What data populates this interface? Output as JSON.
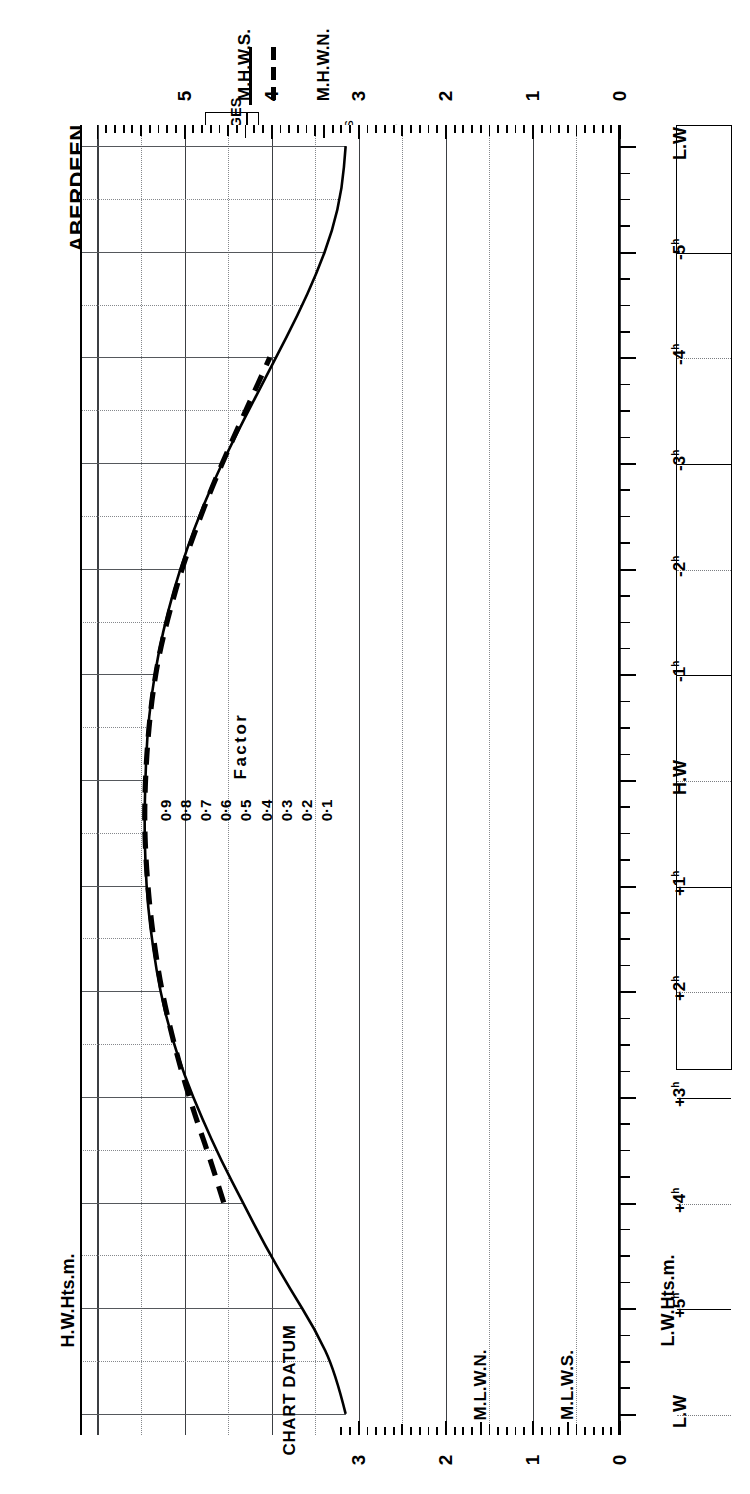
{
  "title": {
    "port": "ABERDEEN",
    "subtitle_line1": "MEAN SPRING",
    "subtitle_line2": "AND NEAP CURVES"
  },
  "legend": {
    "heading": "MEAN RANGES",
    "springs_label": "Springs",
    "springs_value": "3.7m",
    "neaps_label": "Neaps",
    "neaps_value": "1.8m",
    "springs_style": "solid-line",
    "neaps_style": "dashed-line"
  },
  "note": {
    "line1": "Springs occur 2 days",
    "line2": "after",
    "line3": "New and Full Moon."
  },
  "axes": {
    "left_caption": "H.W.Hts.m.",
    "right_caption": "L.W.Hts.m.",
    "datum_label": "CHART DATUM",
    "factor_caption": "Factor",
    "hw_height_labels": [
      "0",
      "1",
      "2",
      "3",
      "4",
      "5"
    ],
    "lw_height_labels": [
      "0",
      "1",
      "2",
      "3"
    ],
    "time_labels": [
      "L.W",
      "-5ʰ",
      "-4ʰ",
      "-3ʰ",
      "-2ʰ",
      "-1ʰ",
      "H.W",
      "+1ʰ",
      "+2ʰ",
      "+3ʰ",
      "+4ʰ",
      "+5ʰ",
      "L.W"
    ],
    "factor_labels": [
      "0·9",
      "0·8",
      "0·7",
      "0·6",
      "0·5",
      "0·4",
      "0·3",
      "0·2",
      "0·1"
    ]
  },
  "levels": {
    "mhws": "M.H.W.S.",
    "mhwn": "M.H.W.N.",
    "mlwn": "M.L.W.N.",
    "mlws": "M.L.W.S."
  },
  "chart_data": {
    "type": "line",
    "xlabel": "Hours relative to High Water",
    "ylabel": "Height (metres)",
    "xlim": [
      -6.2,
      6.2
    ],
    "ylim": [
      0,
      6.2
    ],
    "grid": true,
    "legend_position": "top-left",
    "mean_range_springs_m": 3.7,
    "mean_range_neaps_m": 1.8,
    "mhws_m": 4.3,
    "mhwn_m": 3.4,
    "mlwn_m": 1.6,
    "mlws_m": 0.6,
    "hw_peak_m": 5.45,
    "lw_trough_m": 3.15,
    "series": [
      {
        "name": "Mean Spring curve",
        "style": "solid",
        "x": [
          -6.0,
          -5.6,
          -5.2,
          -4.8,
          -4.4,
          -4.0,
          -3.6,
          -3.2,
          -2.8,
          -2.4,
          -2.0,
          -1.6,
          -1.2,
          -0.8,
          -0.4,
          0.0,
          0.4,
          0.8,
          1.2,
          1.6,
          2.0,
          2.4,
          2.8,
          3.2,
          3.6,
          4.0,
          4.4,
          4.8,
          5.2,
          5.6,
          6.0
        ],
        "y": [
          3.15,
          3.27,
          3.5,
          3.8,
          4.08,
          4.33,
          4.58,
          4.8,
          5.0,
          5.16,
          5.28,
          5.36,
          5.42,
          5.45,
          5.46,
          5.45,
          5.43,
          5.38,
          5.3,
          5.19,
          5.05,
          4.88,
          4.68,
          4.45,
          4.2,
          3.95,
          3.7,
          3.48,
          3.3,
          3.19,
          3.15
        ]
      },
      {
        "name": "Mean Neap curve",
        "style": "dashed",
        "x": [
          -4.0,
          -3.6,
          -3.2,
          -2.8,
          -2.4,
          -2.0,
          -1.6,
          -1.2,
          -0.8,
          -0.4,
          0.0,
          0.4,
          0.8,
          1.2,
          1.6,
          2.0,
          2.4,
          2.8,
          3.2,
          3.6,
          4.0
        ],
        "y": [
          4.55,
          4.7,
          4.87,
          5.02,
          5.15,
          5.26,
          5.34,
          5.4,
          5.44,
          5.46,
          5.45,
          5.42,
          5.37,
          5.29,
          5.17,
          5.03,
          4.86,
          4.67,
          4.46,
          4.24,
          4.02
        ]
      }
    ],
    "factor_scale": {
      "values": [
        0.9,
        0.8,
        0.7,
        0.6,
        0.5,
        0.4,
        0.3,
        0.2,
        0.1
      ],
      "caption": "Factor"
    }
  }
}
